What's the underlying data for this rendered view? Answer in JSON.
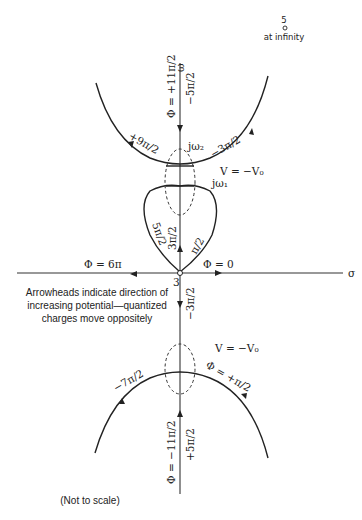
{
  "corner": {
    "label_top": "5",
    "label_bottom": "at infinity"
  },
  "axes": {
    "sigma": "σ",
    "omega": "ω"
  },
  "upper": {
    "phi_axis": "Φ = +11π/2",
    "right_axis": "−5π/2",
    "left_arc": "+9π/2",
    "right_arc": "−3π/2",
    "jw2": "jω₂",
    "jw1": "jω₁",
    "v_label": "V = −V₀",
    "loop_left": "5π/2",
    "loop_mid": "3π/2",
    "loop_right": "π/2"
  },
  "origin": {
    "label": "3",
    "phi_left": "Φ = 6π",
    "phi_right": "Φ = 0"
  },
  "lower": {
    "axis_label": "−3π/2",
    "v_label": "V = −V₀",
    "left_arc": "−7π/2",
    "right_arc": "Φ = +π/2",
    "phi_axis": "Φ = −11π/2",
    "right_axis": "+5π/2"
  },
  "note": {
    "line1": "Arrowheads indicate direction of",
    "line2": "increasing potential—quantized",
    "line3": "charges move oppositely"
  },
  "footer": "(Not to scale)"
}
